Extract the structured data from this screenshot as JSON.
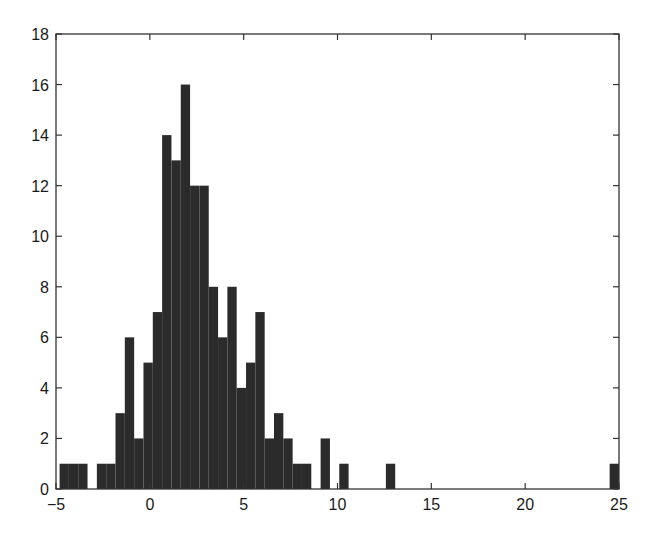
{
  "chart_data": {
    "type": "bar",
    "subtype": "histogram",
    "title": "",
    "xlabel": "",
    "ylabel": "",
    "xlim": [
      -5,
      25
    ],
    "ylim": [
      0,
      18
    ],
    "xticks": [
      -5,
      0,
      5,
      10,
      15,
      20,
      25
    ],
    "yticks": [
      0,
      2,
      4,
      6,
      8,
      10,
      12,
      14,
      16,
      18
    ],
    "xtick_labels": [
      "−5",
      "0",
      "5",
      "10",
      "15",
      "20",
      "25"
    ],
    "ytick_labels": [
      "0",
      "2",
      "4",
      "6",
      "8",
      "10",
      "12",
      "14",
      "16",
      "18"
    ],
    "grid": false,
    "legend": null,
    "bar_color": "#2b2b2b",
    "bin_start": -4.81,
    "bin_width": 0.4968,
    "num_bins": 60,
    "counts": [
      1,
      1,
      1,
      0,
      1,
      1,
      3,
      6,
      2,
      5,
      7,
      14,
      13,
      16,
      12,
      12,
      8,
      6,
      8,
      4,
      5,
      7,
      2,
      3,
      2,
      1,
      1,
      0,
      2,
      0,
      1,
      0,
      0,
      0,
      0,
      1,
      0,
      0,
      0,
      0,
      0,
      0,
      0,
      0,
      0,
      0,
      0,
      0,
      0,
      0,
      0,
      0,
      0,
      0,
      0,
      0,
      0,
      0,
      0,
      1
    ]
  },
  "plot_area": {
    "left": 56,
    "top": 34,
    "right": 619,
    "bottom": 489
  }
}
